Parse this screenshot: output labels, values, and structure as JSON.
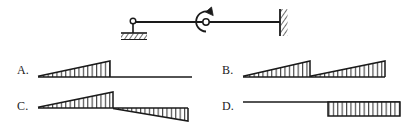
{
  "figure": {
    "kind": "bending-moment-diagram-multiple-choice",
    "stroke_color": "#1a1a1a",
    "background_color": "#ffffff",
    "hatch_color": "#333333"
  },
  "beam": {
    "name": "beam-structure",
    "span_start_x": 128,
    "span_end_x": 280,
    "axis_y": 22,
    "left_support": {
      "type": "pin-support",
      "x": 133,
      "label": "pin"
    },
    "internal_hinge": {
      "type": "internal-hinge",
      "x": 206,
      "label": "hinge"
    },
    "applied_moment": {
      "type": "concentrated-moment",
      "x": 206,
      "direction": "counter-clockwise",
      "label": "M"
    },
    "right_support": {
      "type": "fixed-support",
      "x": 280,
      "label": "fixed"
    }
  },
  "options": [
    {
      "id": "A",
      "label": "A.",
      "label_x": 17,
      "label_y": 71,
      "baseline_y": 77,
      "x_start": 38,
      "x_mid": 110,
      "x_end": 190,
      "description": "triangular moment rising from zero at left to peak at hinge, then zero to right end",
      "segments": [
        {
          "from_x": 38,
          "to_x": 110,
          "from_value": 0,
          "to_value": 16,
          "side": "above",
          "hatched": true
        },
        {
          "from_x": 110,
          "to_x": 190,
          "from_value": 0,
          "to_value": 0,
          "side": "zero",
          "hatched": false
        }
      ]
    },
    {
      "id": "B",
      "label": "B.",
      "label_x": 222,
      "label_y": 71,
      "baseline_y": 77,
      "x_start": 243,
      "x_mid": 310,
      "x_end": 385,
      "description": "two triangles both rising left to right, resetting to zero at the hinge",
      "segments": [
        {
          "from_x": 243,
          "to_x": 310,
          "from_value": 0,
          "to_value": 16,
          "side": "above",
          "hatched": true
        },
        {
          "from_x": 310,
          "to_x": 385,
          "from_value": 0,
          "to_value": 16,
          "side": "above",
          "hatched": true
        }
      ]
    },
    {
      "id": "C",
      "label": "C.",
      "label_x": 17,
      "label_y": 107,
      "baseline_y": 108,
      "x_start": 38,
      "x_mid": 113,
      "x_end": 188,
      "description": "triangle above the axis on the left peaking at the hinge, then triangle below the axis growing to the fixed end",
      "segments": [
        {
          "from_x": 38,
          "to_x": 113,
          "from_value": 0,
          "to_value": 16,
          "side": "above",
          "hatched": true
        },
        {
          "from_x": 113,
          "to_x": 188,
          "from_value": 0,
          "to_value": 16,
          "side": "below",
          "hatched": true
        }
      ]
    },
    {
      "id": "D",
      "label": "D.",
      "label_x": 222,
      "label_y": 107,
      "baseline_y": 102,
      "x_start": 243,
      "x_mid": 328,
      "x_end": 400,
      "description": "zero from left to hinge, then constant rectangular block below the axis to the fixed end",
      "segments": [
        {
          "from_x": 243,
          "to_x": 328,
          "from_value": 0,
          "to_value": 0,
          "side": "zero",
          "hatched": false
        },
        {
          "from_x": 328,
          "to_x": 400,
          "from_value": 18,
          "to_value": 18,
          "side": "below",
          "hatched": true
        }
      ]
    }
  ]
}
